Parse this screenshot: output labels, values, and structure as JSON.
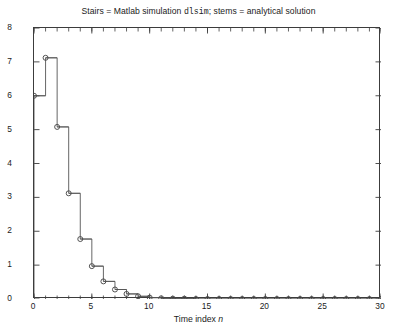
{
  "chart_data": {
    "type": "line",
    "title": "Stairs = Matlab simulation dlsim; stems = analytical solution",
    "title_parts": {
      "pre": "Stairs = Matlab simulation ",
      "mono": "dlsim",
      "post": "; stems = analytical solution"
    },
    "xlabel_pre": "Time index ",
    "xlabel_italic": "n",
    "ylabel_pre": "y",
    "ylabel_italic": "",
    "ylabel_post": "(n)",
    "ylabel_full": "y(n)",
    "xlim": [
      0,
      30
    ],
    "ylim": [
      0,
      8
    ],
    "xticks": [
      0,
      5,
      10,
      15,
      20,
      25,
      30
    ],
    "xtick_labels": [
      "0",
      "5",
      "10",
      "15",
      "20",
      "25",
      "30"
    ],
    "xminor_step": 1,
    "yticks": [
      0,
      1,
      2,
      3,
      4,
      5,
      6,
      7,
      8
    ],
    "ytick_labels": [
      "0",
      "1",
      "2",
      "3",
      "4",
      "5",
      "6",
      "7",
      "8"
    ],
    "grid": false,
    "legend": "none",
    "box": true,
    "series": [
      {
        "name": "stairs = Matlab simulation dlsim",
        "style": "stairs",
        "color": "#555555"
      },
      {
        "name": "stems = analytical solution",
        "style": "stem-circle-markers",
        "color": "#555555",
        "marker": "open-circle"
      }
    ],
    "x": [
      0,
      1,
      2,
      3,
      4,
      5,
      6,
      7,
      8,
      9,
      10,
      11,
      12,
      13,
      14,
      15,
      16,
      17,
      18,
      19,
      20,
      21,
      22,
      23,
      24,
      25,
      26,
      27,
      28,
      29,
      30
    ],
    "values": [
      6.0,
      7.12,
      5.08,
      3.12,
      1.77,
      0.97,
      0.52,
      0.28,
      0.15,
      0.08,
      0.04,
      0.02,
      0.01,
      0.01,
      0.0,
      0.0,
      0.0,
      0.0,
      0.0,
      0.0,
      0.0,
      0.0,
      0.0,
      0.0,
      0.0,
      0.0,
      0.0,
      0.0,
      0.0,
      0.0,
      0.0
    ]
  }
}
